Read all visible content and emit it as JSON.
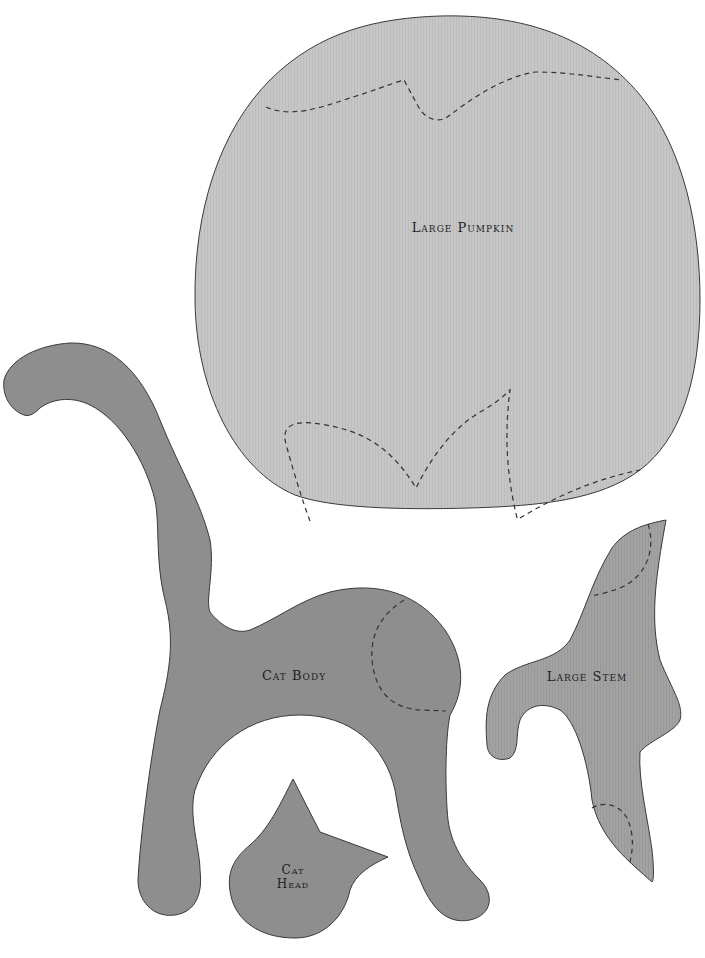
{
  "colors": {
    "background": "#ffffff",
    "pumpkin_fill": "#c6c6c6",
    "cat_fill": "#8e8e8e",
    "stem_fill": "#a0a0a0",
    "outline": "#3a3a3a",
    "stitch_line": "#333333",
    "label_text": "#1e1e1e"
  },
  "pieces": {
    "large_pumpkin": {
      "label": "Large Pumpkin"
    },
    "cat_body": {
      "label": "Cat Body"
    },
    "large_stem": {
      "label": "Large Stem"
    },
    "cat_head": {
      "label_line1": "Cat",
      "label_line2": "Head"
    }
  }
}
